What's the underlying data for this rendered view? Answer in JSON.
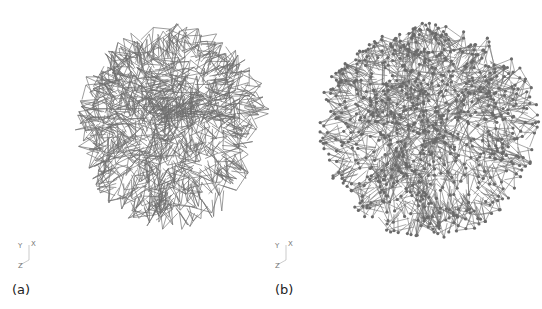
{
  "figure": {
    "panels": [
      {
        "id": "a",
        "label": "(a)",
        "style": "wireframe",
        "description": "3D network rendering, edges only",
        "center": [
          172,
          118
        ],
        "radius": [
          98,
          100
        ],
        "edge_color": "#6e6e6e",
        "node_color": null,
        "axes": {
          "x": "X",
          "y": "Y",
          "z": "Z"
        }
      },
      {
        "id": "b",
        "label": "(b)",
        "style": "ball-and-stick",
        "description": "3D network rendering, edges with node spheres",
        "center": [
          158,
          122
        ],
        "radius": [
          110,
          105
        ],
        "edge_color": "#707070",
        "node_color": "#6a6a6a",
        "axes": {
          "x": "X",
          "y": "Y",
          "z": "Z"
        }
      }
    ]
  }
}
